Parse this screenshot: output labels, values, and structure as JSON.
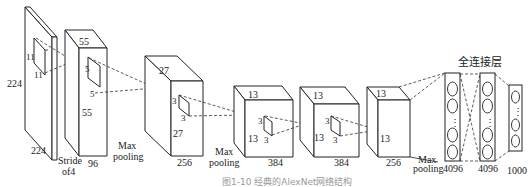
{
  "figure": {
    "caption": "图1-10  经典的AlexNet网络结构",
    "input_layer": {
      "height": "224",
      "width": "224",
      "kernel_h": "11",
      "kernel_w": "11",
      "stride_label_1": "Stride",
      "stride_label_2": "of4"
    },
    "conv1": {
      "height": "55",
      "width": "55",
      "depth": "96",
      "kernel_h": "5",
      "kernel_w": "5"
    },
    "pool1_label_1": "Max",
    "pool1_label_2": "pooling",
    "conv2": {
      "height": "27",
      "width": "27",
      "depth": "256",
      "kernel_h": "3",
      "kernel_w": "3"
    },
    "pool2_label_1": "Max",
    "pool2_label_2": "pooling",
    "conv3": {
      "height": "13",
      "width": "13",
      "depth": "384",
      "kernel_h": "3",
      "kernel_w": "3"
    },
    "conv4": {
      "height": "13",
      "width": "13",
      "depth": "384",
      "kernel_h": "3",
      "kernel_w": "3"
    },
    "conv5": {
      "height": "13",
      "width": "13",
      "depth": "256"
    },
    "pool3_label_1": "Max",
    "pool3_label_2": "pooling",
    "fc_title": "全连接层",
    "fc1": {
      "units": "4096"
    },
    "fc2": {
      "units": "4096"
    },
    "fc3": {
      "units": "1000"
    },
    "ellipsis": "⋮"
  }
}
